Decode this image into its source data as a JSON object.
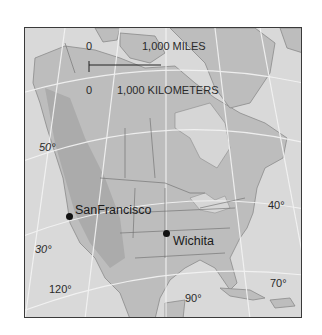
{
  "map": {
    "type": "reference map",
    "region": "North America",
    "scale_bar": {
      "miles_zero": "0",
      "miles_label": "1,000 MILES",
      "km_zero": "0",
      "km_label": "1,000 KILOMETERS"
    },
    "latitude_labels": [
      "50°",
      "40°",
      "30°"
    ],
    "longitude_labels": [
      "120°",
      "90°",
      "70°"
    ],
    "cities": [
      {
        "name": "SanFrancisco"
      },
      {
        "name": "Wichita"
      }
    ],
    "colors": {
      "ocean": "#d9d9d9",
      "land": "#bdbdbd",
      "graticule": "#f4f4f4",
      "border": "#6a6a6a",
      "text": "#2a2a2a"
    }
  }
}
